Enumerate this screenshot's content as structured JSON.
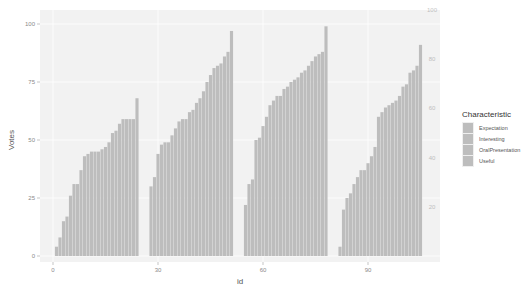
{
  "chart_data": {
    "type": "bar",
    "title": "",
    "xlabel": "id",
    "ylabel": "Votes",
    "xlim": [
      -5,
      108
    ],
    "ylim": [
      0,
      100
    ],
    "x_ticks": [
      0,
      30,
      60,
      90
    ],
    "y_ticks": [
      0,
      25,
      50,
      75,
      100
    ],
    "secondary_y_ticks": [
      20,
      40,
      60,
      80,
      100
    ],
    "grid": true,
    "legend_position": "right",
    "legend": {
      "title": "Characteristic",
      "entries": [
        "Expectation",
        "Interesting",
        "OralPresentation",
        "Useful"
      ]
    },
    "bar_color": "#bdbdbd",
    "panel_background": "#f2f2f2",
    "series": [
      {
        "name": "group-1",
        "x": [
          1,
          2,
          3,
          4,
          5,
          6,
          7,
          8,
          9,
          10,
          11,
          12,
          13,
          14,
          15,
          16,
          17,
          18,
          19,
          20,
          21,
          22,
          23,
          24
        ],
        "values": [
          4,
          8,
          15,
          17,
          26,
          31,
          31,
          37,
          43,
          44,
          45,
          45,
          45,
          46,
          47,
          49,
          53,
          54,
          57,
          59,
          59,
          59,
          59,
          68
        ]
      },
      {
        "name": "group-2",
        "x": [
          28,
          29,
          30,
          31,
          32,
          33,
          34,
          35,
          36,
          37,
          38,
          39,
          40,
          41,
          42,
          43,
          44,
          45,
          46,
          47,
          48,
          49,
          50,
          51
        ],
        "values": [
          30,
          34,
          44,
          48,
          49,
          49,
          52,
          55,
          58,
          59,
          59,
          62,
          63,
          66,
          68,
          71,
          75,
          78,
          81,
          82,
          83,
          86,
          88,
          97
        ]
      },
      {
        "name": "group-3",
        "x": [
          55,
          56,
          57,
          58,
          59,
          60,
          61,
          62,
          63,
          64,
          65,
          66,
          67,
          68,
          69,
          70,
          71,
          72,
          73,
          74,
          75,
          76,
          77,
          78
        ],
        "values": [
          22,
          31,
          33,
          50,
          51,
          56,
          60,
          65,
          67,
          69,
          69,
          72,
          73,
          75,
          76,
          77,
          79,
          80,
          82,
          84,
          86,
          87,
          88,
          99
        ]
      },
      {
        "name": "group-4",
        "x": [
          82,
          83,
          84,
          85,
          86,
          87,
          88,
          89,
          90,
          91,
          92,
          93,
          94,
          95,
          96,
          97,
          98,
          99,
          100,
          101,
          102,
          103,
          104,
          105
        ],
        "values": [
          4,
          20,
          25,
          27,
          31,
          34,
          37,
          37,
          40,
          43,
          47,
          60,
          62,
          64,
          65,
          66,
          67,
          69,
          73,
          74,
          79,
          80,
          82,
          91
        ]
      }
    ]
  }
}
